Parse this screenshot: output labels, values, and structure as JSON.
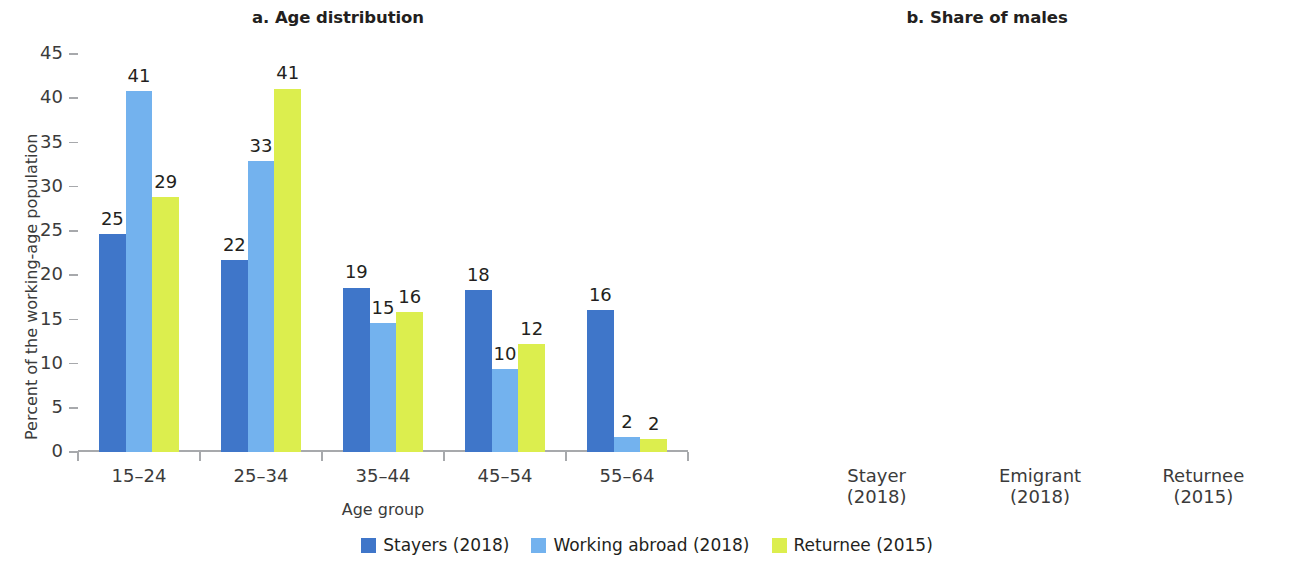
{
  "colors": {
    "stayers": "#3f76c9",
    "working_abroad": "#73b2ee",
    "returnee": "#dcee4e",
    "axis": "#a7a9ac",
    "text": "#231f20",
    "tick_text": "#3b3b3b"
  },
  "legend": {
    "items": [
      {
        "label": "Stayers (2018)",
        "color": "#3f76c9"
      },
      {
        "label": "Working abroad (2018)",
        "color": "#73b2ee"
      },
      {
        "label": "Returnee (2015)",
        "color": "#dcee4e"
      }
    ]
  },
  "chart_data": [
    {
      "type": "bar",
      "id": "age-distribution",
      "title": "a. Age distribution",
      "xlabel": "Age group",
      "ylabel": "Percent of the working-age population",
      "ylim": [
        0,
        45
      ],
      "yticks": [
        0,
        5,
        10,
        15,
        20,
        25,
        30,
        35,
        40,
        45
      ],
      "ytick_labels": [
        "0",
        "5",
        "10",
        "15",
        "20",
        "25",
        "30",
        "35",
        "40",
        "45"
      ],
      "grid": false,
      "legend_position": "bottom",
      "categories": [
        "15–24",
        "25–34",
        "35–44",
        "45–54",
        "55–64"
      ],
      "series": [
        {
          "name": "Stayers (2018)",
          "color": "#3f76c9",
          "values": [
            24.7,
            21.7,
            18.6,
            18.3,
            16.1
          ],
          "labels": [
            "25",
            "22",
            "19",
            "18",
            "16"
          ]
        },
        {
          "name": "Working abroad (2018)",
          "color": "#73b2ee",
          "values": [
            40.8,
            32.9,
            14.6,
            9.4,
            1.7
          ],
          "labels": [
            "41",
            "33",
            "15",
            "10",
            "2"
          ]
        },
        {
          "name": "Returnee (2015)",
          "color": "#dcee4e",
          "values": [
            28.8,
            41.1,
            15.8,
            12.2,
            1.5
          ],
          "labels": [
            "29",
            "41",
            "16",
            "12",
            "2"
          ]
        }
      ]
    },
    {
      "type": "bar",
      "id": "share-of-males",
      "title": "b. Share of males",
      "xlabel": "",
      "ylabel": "Percent of the working-age population",
      "ylim": [
        0,
        90
      ],
      "yticks": [
        0,
        10,
        20,
        30,
        40,
        50,
        60,
        70,
        80,
        90
      ],
      "ytick_labels": [
        "0",
        "10",
        "20",
        "30",
        "40",
        "50",
        "60",
        "70",
        "80",
        "90"
      ],
      "grid": false,
      "legend_position": "bottom",
      "categories": [
        "Stayer",
        "Emigrant",
        "Returnee"
      ],
      "category_sublabels": [
        "(2018)",
        "(2018)",
        "(2015)"
      ],
      "values": [
        47,
        77.5,
        75.3
      ],
      "value_labels": [
        "47",
        "78",
        "76"
      ],
      "bar_colors": [
        "#3f76c9",
        "#73b2ee",
        "#dcee4e"
      ]
    }
  ]
}
